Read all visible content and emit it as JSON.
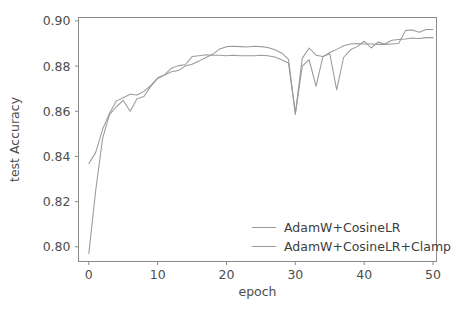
{
  "chart_data": {
    "type": "line",
    "title": "",
    "xlabel": "epoch",
    "ylabel": "test Accuracy",
    "xlim": [
      -1.5,
      50.5
    ],
    "ylim": [
      0.7935,
      0.9015
    ],
    "xticks": [
      0,
      10,
      20,
      30,
      40,
      50
    ],
    "xtick_labels": [
      "0",
      "10",
      "20",
      "30",
      "40",
      "50"
    ],
    "yticks": [
      0.8,
      0.82,
      0.84,
      0.86,
      0.88,
      0.9
    ],
    "ytick_labels": [
      "0.80",
      "0.82",
      "0.84",
      "0.86",
      "0.88",
      "0.90"
    ],
    "grid": false,
    "legend_position": "lower right",
    "line_color": "#9a9a9a",
    "axis_color": "#8a8a8a",
    "text_color": "#4d4d4d",
    "x": [
      0,
      1,
      2,
      3,
      4,
      5,
      6,
      7,
      8,
      9,
      10,
      11,
      12,
      13,
      14,
      15,
      16,
      17,
      18,
      19,
      20,
      21,
      22,
      23,
      24,
      25,
      26,
      27,
      28,
      29,
      30,
      31,
      32,
      33,
      34,
      35,
      36,
      37,
      38,
      39,
      40,
      41,
      42,
      43,
      44,
      45,
      46,
      47,
      48,
      49,
      50
    ],
    "series": [
      {
        "name": "AdamW+CosineLR",
        "values": [
          0.797,
          0.825,
          0.848,
          0.8585,
          0.862,
          0.8648,
          0.86,
          0.8655,
          0.8665,
          0.871,
          0.8745,
          0.876,
          0.8775,
          0.878,
          0.88,
          0.8808,
          0.8822,
          0.8838,
          0.8852,
          0.8876,
          0.8886,
          0.8888,
          0.8886,
          0.8884,
          0.8888,
          0.8886,
          0.8882,
          0.8872,
          0.8858,
          0.883,
          0.8592,
          0.8834,
          0.888,
          0.8848,
          0.8842,
          0.886,
          0.8874,
          0.889,
          0.8898,
          0.89,
          0.8898,
          0.8898,
          0.8896,
          0.8896,
          0.8898,
          0.89,
          0.8958,
          0.896,
          0.895,
          0.8962,
          0.8962
        ],
        "color": "#9a9a9a"
      },
      {
        "name": "AdamW+CosineLR+Clamp",
        "values": [
          0.8368,
          0.8418,
          0.852,
          0.859,
          0.8646,
          0.866,
          0.8675,
          0.8672,
          0.8688,
          0.8714,
          0.8748,
          0.8762,
          0.879,
          0.8802,
          0.8806,
          0.8842,
          0.8846,
          0.885,
          0.8848,
          0.8848,
          0.8846,
          0.8848,
          0.8846,
          0.8846,
          0.8846,
          0.8848,
          0.8846,
          0.884,
          0.8828,
          0.8814,
          0.8586,
          0.88,
          0.8828,
          0.871,
          0.8842,
          0.8855,
          0.8695,
          0.8838,
          0.8872,
          0.8886,
          0.891,
          0.888,
          0.8906,
          0.8898,
          0.8914,
          0.8918,
          0.892,
          0.8924,
          0.8922,
          0.8926,
          0.8926
        ],
        "color": "#9a9a9a"
      }
    ]
  },
  "legend": {
    "entries": [
      {
        "label": "AdamW+CosineLR"
      },
      {
        "label": "AdamW+CosineLR+Clamp"
      }
    ]
  }
}
